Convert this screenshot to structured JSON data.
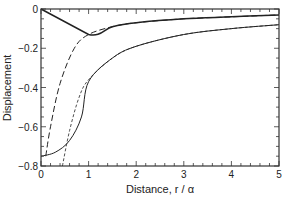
{
  "chart_data": {
    "type": "line",
    "title": "",
    "xlabel": "Distance, r / α",
    "ylabel": "Displacement",
    "xlim": [
      0,
      5
    ],
    "ylim": [
      -0.8,
      0
    ],
    "xticks": [
      "0",
      "1",
      "2",
      "3",
      "4",
      "5"
    ],
    "yticks": [
      "0",
      "-0.2",
      "-0.4",
      "-0.6",
      "-0.8"
    ],
    "grid": false,
    "legend": null,
    "series": [
      {
        "name": "solid-thick (upper)",
        "style": "solid",
        "x": [
          0,
          1,
          1.5,
          2,
          3,
          4,
          5
        ],
        "y": [
          0,
          -0.13,
          -0.09,
          -0.07,
          -0.05,
          -0.04,
          -0.03
        ]
      },
      {
        "name": "long-dash (upper)",
        "style": "long-dash",
        "x": [
          0.1,
          0.2,
          0.4,
          0.7,
          1,
          1.5,
          2,
          3,
          4,
          5
        ],
        "y": [
          -0.75,
          -0.6,
          -0.38,
          -0.2,
          -0.13,
          -0.09,
          -0.07,
          -0.05,
          -0.04,
          -0.03
        ]
      },
      {
        "name": "solid-thin (lower)",
        "style": "solid",
        "x": [
          0,
          0.3,
          0.6,
          0.85,
          1,
          1.5,
          2,
          3,
          4,
          5
        ],
        "y": [
          -0.75,
          -0.73,
          -0.67,
          -0.55,
          -0.37,
          -0.25,
          -0.19,
          -0.13,
          -0.1,
          -0.08
        ]
      },
      {
        "name": "short-dash (lower)",
        "style": "short-dash",
        "x": [
          0.45,
          0.6,
          0.8,
          1,
          1.5,
          2,
          3,
          4,
          5
        ],
        "y": [
          -0.8,
          -0.62,
          -0.45,
          -0.36,
          -0.25,
          -0.19,
          -0.13,
          -0.1,
          -0.08
        ]
      }
    ]
  }
}
